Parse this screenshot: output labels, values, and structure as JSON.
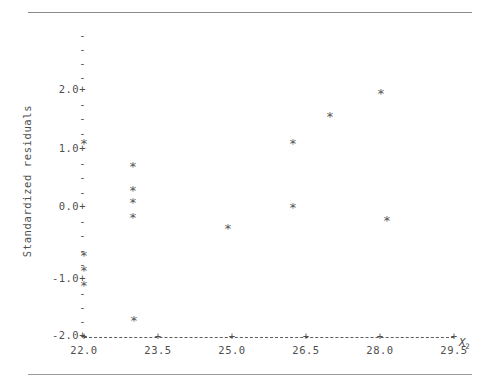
{
  "figure": {
    "y_axis_title": "Standardized residuals",
    "x_axis_title": "X",
    "x_axis_title_sub": "2",
    "point_glyph": "*",
    "axis_color": "#4f4f4f",
    "point_color": "#555555"
  },
  "y_axis": {
    "major_labels": [
      "2.0+",
      "1.0+",
      "0.0+",
      "-1.0+",
      "-2.0+"
    ],
    "minor_label": "-",
    "ticks": [
      {
        "text": "-",
        "type": "minor",
        "top": 30
      },
      {
        "text": "-",
        "type": "minor",
        "top": 44
      },
      {
        "text": "-",
        "type": "minor",
        "top": 58
      },
      {
        "text": "-",
        "type": "minor",
        "top": 72
      },
      {
        "text": "2.0+",
        "type": "major",
        "top": 84
      },
      {
        "text": "-",
        "type": "minor",
        "top": 99
      },
      {
        "text": "-",
        "type": "minor",
        "top": 113
      },
      {
        "text": "-",
        "type": "minor",
        "top": 128
      },
      {
        "text": "-",
        "type": "minor",
        "top": 142
      },
      {
        "text": "1.0+",
        "type": "major",
        "top": 143
      },
      {
        "text": "-",
        "type": "minor",
        "top": 158
      },
      {
        "text": "-",
        "type": "minor",
        "top": 172
      },
      {
        "text": "-",
        "type": "minor",
        "top": 187
      },
      {
        "text": "0.0+",
        "type": "major",
        "top": 201
      },
      {
        "text": "-",
        "type": "minor",
        "top": 216
      },
      {
        "text": "-",
        "type": "minor",
        "top": 230
      },
      {
        "text": "-",
        "type": "minor",
        "top": 245
      },
      {
        "text": "-",
        "type": "minor",
        "top": 259
      },
      {
        "text": "-1.0+",
        "type": "major",
        "top": 273
      },
      {
        "text": "-",
        "type": "minor",
        "top": 288
      },
      {
        "text": "-",
        "type": "minor",
        "top": 302
      },
      {
        "text": "-",
        "type": "minor",
        "top": 316
      },
      {
        "text": "-2.0+",
        "type": "major",
        "top": 330
      }
    ]
  },
  "x_axis": {
    "tick_glyph": "+",
    "tick_labels": [
      "22.0",
      "23.5",
      "25.0",
      "26.5",
      "28.0",
      "29.5"
    ],
    "tick_values": [
      22.0,
      23.5,
      25.0,
      26.5,
      28.0,
      29.5
    ],
    "tick_px": [
      84,
      158,
      232,
      306,
      380,
      454
    ]
  },
  "chart_data": {
    "type": "scatter",
    "title": "",
    "xlabel": "X2",
    "ylabel": "Standardized residuals",
    "xlim": [
      22.0,
      29.5
    ],
    "ylim": [
      -2.3,
      2.5
    ],
    "grid": false,
    "legend": null,
    "marker": "*",
    "points": [
      {
        "x": 22.05,
        "y": 1.0,
        "px": 84,
        "py": 143
      },
      {
        "x": 23.4,
        "y": 0.56,
        "px": 133,
        "py": 166
      },
      {
        "x": 23.4,
        "y": 0.2,
        "px": 133,
        "py": 190
      },
      {
        "x": 23.4,
        "y": -0.02,
        "px": 133,
        "py": 202
      },
      {
        "x": 23.4,
        "y": -0.24,
        "px": 133,
        "py": 217
      },
      {
        "x": 22.05,
        "y": -0.78,
        "px": 84,
        "py": 255
      },
      {
        "x": 22.05,
        "y": -1.0,
        "px": 84,
        "py": 270
      },
      {
        "x": 22.05,
        "y": -1.22,
        "px": 84,
        "py": 285
      },
      {
        "x": 23.45,
        "y": -1.93,
        "px": 134,
        "py": 320
      },
      {
        "x": 25.0,
        "y": -0.43,
        "px": 228,
        "py": 228
      },
      {
        "x": 26.4,
        "y": 1.0,
        "px": 293,
        "py": 143
      },
      {
        "x": 26.4,
        "y": 0.0,
        "px": 293,
        "py": 207
      },
      {
        "x": 26.7,
        "y": 1.39,
        "px": 330,
        "py": 116
      },
      {
        "x": 28.1,
        "y": 1.84,
        "px": 381,
        "py": 93
      },
      {
        "x": 28.1,
        "y": -0.32,
        "px": 387,
        "py": 220
      }
    ]
  }
}
